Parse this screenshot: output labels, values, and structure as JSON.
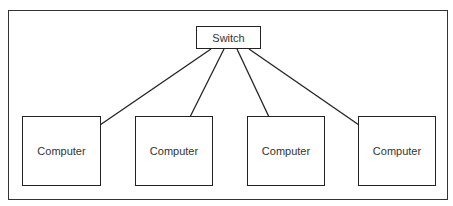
{
  "diagram": {
    "type": "star-network",
    "switch": {
      "label": "Switch"
    },
    "computers": [
      {
        "label": "Computer"
      },
      {
        "label": "Computer"
      },
      {
        "label": "Computer"
      },
      {
        "label": "Computer"
      }
    ],
    "edges": [
      {
        "from": "Switch",
        "to": "Computer 1"
      },
      {
        "from": "Switch",
        "to": "Computer 2"
      },
      {
        "from": "Switch",
        "to": "Computer 3"
      },
      {
        "from": "Switch",
        "to": "Computer 4"
      }
    ]
  }
}
